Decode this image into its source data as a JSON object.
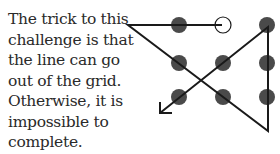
{
  "caption": {
    "lines": [
      "The trick to this",
      "challenge is that",
      "the line can go",
      "out of the grid.",
      "Otherwise, it is",
      "impossible to",
      "complete."
    ]
  },
  "puzzle": {
    "name": "nine-dots",
    "dot_color": "#4a4a4a",
    "line_color": "#1a1a1a",
    "start_dot": {
      "row": 0,
      "col": 1,
      "style": "open-circle"
    },
    "grid": [
      [
        {
          "x": 179,
          "y": 25
        },
        {
          "x": 223,
          "y": 25
        },
        {
          "x": 267,
          "y": 25
        }
      ],
      [
        {
          "x": 179,
          "y": 63
        },
        {
          "x": 223,
          "y": 63
        },
        {
          "x": 267,
          "y": 63
        }
      ],
      [
        {
          "x": 179,
          "y": 97
        },
        {
          "x": 223,
          "y": 97
        },
        {
          "x": 267,
          "y": 97
        }
      ]
    ],
    "path": [
      {
        "x": 222,
        "y": 25
      },
      {
        "x": 128,
        "y": 25
      },
      {
        "x": 268,
        "y": 131
      },
      {
        "x": 268,
        "y": 27
      },
      {
        "x": 160,
        "y": 113
      }
    ]
  }
}
